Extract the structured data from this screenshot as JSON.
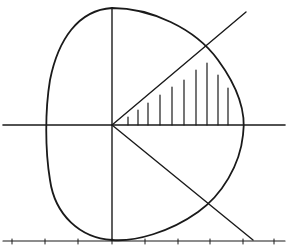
{
  "diagram": {
    "type": "polar-region",
    "colors": {
      "ink": "#1a1a1a",
      "background": "#ffffff"
    },
    "origin": [
      112,
      125
    ],
    "axes": {
      "x": {
        "from": [
          3,
          125
        ],
        "to": [
          285,
          125
        ]
      },
      "y": {
        "from": [
          112,
          8
        ],
        "to": [
          112,
          240
        ]
      }
    },
    "rays": [
      {
        "name": "upper-ray",
        "to": [
          246,
          12
        ]
      },
      {
        "name": "lower-ray",
        "to": [
          253,
          240
        ]
      }
    ],
    "curve": "M112,8 C150,8 195,28 218,60 C240,90 246,115 243,135 C240,165 222,195 198,212 C170,232 135,242 112,240 C80,238 55,215 50,180 C45,150 45,110 50,80 C58,40 78,10 112,8 Z",
    "hatch_x": [
      128,
      138,
      148,
      160,
      172,
      184,
      196,
      207,
      218,
      228
    ],
    "hatch_tops": [
      117,
      110,
      103,
      95,
      87,
      80,
      70,
      63,
      75,
      88
    ],
    "bottom_baseline": {
      "y": 241,
      "ticks": [
        12,
        45,
        78,
        112,
        145,
        178,
        210,
        243,
        274
      ]
    }
  }
}
